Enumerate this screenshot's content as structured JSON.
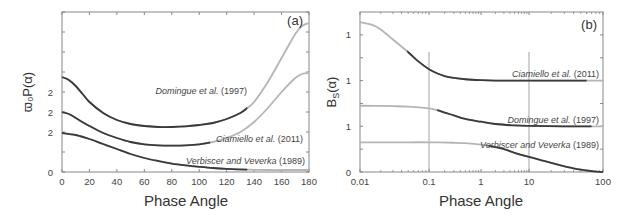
{
  "chart_data": [
    {
      "panel": "(a)",
      "type": "line",
      "xlabel": "Phase Angle",
      "ylabel": "ϖ₀P(α)",
      "xscale": "linear",
      "xlim": [
        0,
        180
      ],
      "ylim": [
        0,
        8
      ],
      "xticks": [
        0,
        20,
        40,
        60,
        80,
        100,
        120,
        140,
        160,
        180
      ],
      "xtick_labels": [
        "0",
        "20",
        "40",
        "60",
        "80",
        "100",
        "120",
        "140",
        "160",
        "180"
      ],
      "yticks": [
        0,
        1,
        2,
        3,
        4,
        5,
        6,
        7,
        8
      ],
      "ytick_labels": [
        {
          "value": 0,
          "label": "0"
        },
        {
          "value": 2,
          "label": "2"
        },
        {
          "value": 3,
          "label": "2"
        },
        {
          "value": 4,
          "label": "2"
        }
      ],
      "series": [
        {
          "name": "Domingue et al. (1997)",
          "label_main": "Domingue et al.",
          "label_year": "(1997)",
          "x": [
            0,
            5,
            10,
            15,
            20,
            30,
            40,
            50,
            60,
            70,
            80,
            90,
            100,
            110,
            120,
            130,
            135,
            140,
            150,
            160,
            170,
            175,
            180
          ],
          "y": [
            4.75,
            4.6,
            4.3,
            3.9,
            3.5,
            2.95,
            2.6,
            2.4,
            2.3,
            2.25,
            2.25,
            2.28,
            2.35,
            2.45,
            2.65,
            2.95,
            3.2,
            3.5,
            4.5,
            5.7,
            6.9,
            7.3,
            7.45
          ],
          "dark_range": [
            0,
            135
          ]
        },
        {
          "name": "Ciamiello et al. (2011)",
          "label_main": "Ciamiello et al.",
          "label_year": "(2011)",
          "x": [
            0,
            5,
            10,
            20,
            30,
            40,
            50,
            60,
            70,
            80,
            90,
            100,
            110,
            120,
            130,
            140,
            150,
            160,
            170,
            175,
            180
          ],
          "y": [
            3.0,
            2.9,
            2.7,
            2.3,
            1.95,
            1.7,
            1.5,
            1.38,
            1.33,
            1.32,
            1.33,
            1.38,
            1.5,
            1.7,
            2.0,
            2.5,
            3.2,
            4.0,
            4.7,
            4.9,
            4.95
          ],
          "dark_range": [
            0,
            108
          ]
        },
        {
          "name": "Verbiscer and Veverka (1989)",
          "label_main": "Verbiscer and Veverka",
          "label_year": "(1989)",
          "x": [
            0,
            10,
            20,
            30,
            40,
            50,
            60,
            70,
            80,
            90,
            100,
            110,
            120,
            135,
            150,
            165,
            180
          ],
          "y": [
            1.95,
            1.85,
            1.65,
            1.4,
            1.15,
            0.9,
            0.7,
            0.55,
            0.42,
            0.33,
            0.26,
            0.2,
            0.16,
            0.12,
            0.1,
            0.1,
            0.1
          ],
          "dark_range": [
            0,
            135
          ]
        }
      ]
    },
    {
      "panel": "(b)",
      "type": "line",
      "xlabel": "Phase Angle",
      "ylabel": "B_S(α)",
      "ylabel_main": "B",
      "ylabel_sub": "S",
      "ylabel_tail": "(α)",
      "xscale": "log",
      "xlim": [
        0.01,
        100
      ],
      "ylim": [
        0,
        3.5
      ],
      "xticks": [
        0.01,
        0.1,
        1,
        10,
        100
      ],
      "xtick_labels": [
        "0.01",
        "0.1",
        "1",
        "10",
        "100"
      ],
      "gridlines_x": [
        0.1,
        10
      ],
      "yticks": [
        0,
        0.5,
        1,
        1.5,
        2,
        2.5,
        3
      ],
      "ytick_labels": [
        {
          "value": 0,
          "label": "0"
        },
        {
          "value": 1,
          "label": "1"
        },
        {
          "value": 2,
          "label": "1"
        },
        {
          "value": 3,
          "label": "1"
        }
      ],
      "series": [
        {
          "name": "Ciamiello et al. (2011)",
          "label_main": "Ciamiello et al.",
          "label_year": "(2011)",
          "x": [
            0.01,
            0.015,
            0.02,
            0.03,
            0.05,
            0.07,
            0.1,
            0.15,
            0.2,
            0.3,
            0.5,
            1,
            2,
            5,
            10,
            30,
            60,
            100
          ],
          "y": [
            3.28,
            3.22,
            3.12,
            2.9,
            2.62,
            2.42,
            2.25,
            2.15,
            2.1,
            2.06,
            2.03,
            2.01,
            2.0,
            2.0,
            2.0,
            2.0,
            2.0,
            2.0
          ],
          "dark_range": [
            0.05,
            60
          ]
        },
        {
          "name": "Domingue et al. (1997)",
          "label_main": "Domingue et al.",
          "label_year": "(1997)",
          "x": [
            0.01,
            0.03,
            0.05,
            0.1,
            0.15,
            0.2,
            0.3,
            0.5,
            1,
            2,
            5,
            10,
            30,
            60,
            100
          ],
          "y": [
            1.45,
            1.44,
            1.43,
            1.39,
            1.35,
            1.3,
            1.24,
            1.16,
            1.1,
            1.05,
            1.02,
            1.01,
            1.0,
            1.0,
            1.0
          ],
          "dark_range": [
            0.15,
            70
          ]
        },
        {
          "name": "Verbiscer and Veverka (1989)",
          "label_main": "Verbiscer and Veverka",
          "label_year": "(1989)",
          "x": [
            0.01,
            0.05,
            0.1,
            0.3,
            0.5,
            1,
            1.5,
            3,
            5,
            10,
            20,
            40,
            70,
            100
          ],
          "y": [
            0.65,
            0.65,
            0.65,
            0.64,
            0.63,
            0.6,
            0.57,
            0.5,
            0.42,
            0.33,
            0.2,
            0.08,
            0.02,
            0.0
          ],
          "dark_range": [
            1.5,
            100
          ]
        }
      ]
    }
  ],
  "colors": {
    "dark_line": "#3a3a3a",
    "light_line": "#b5b5b5",
    "frame": "#888888",
    "grid": "#999999",
    "text": "#444444"
  }
}
